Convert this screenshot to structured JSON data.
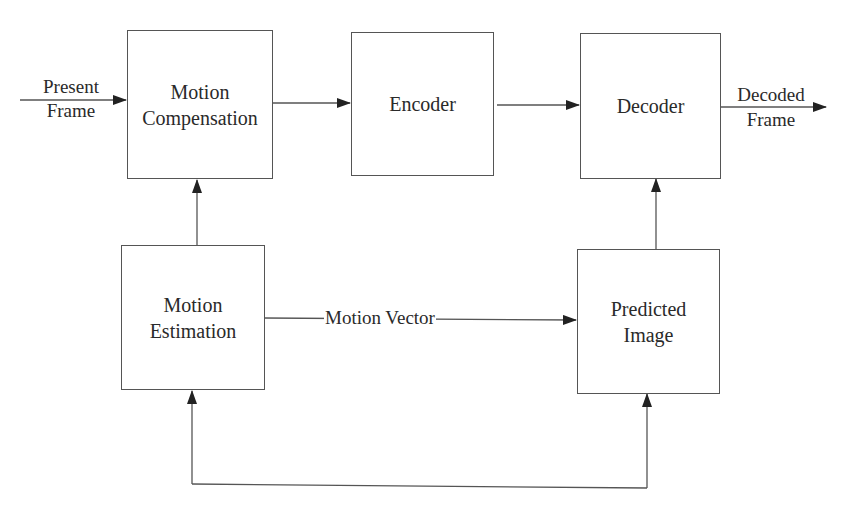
{
  "diagram": {
    "type": "block-diagram",
    "blocks": {
      "motion_compensation": {
        "line1": "Motion",
        "line2": "Compensation"
      },
      "encoder": {
        "label": "Encoder"
      },
      "decoder": {
        "label": "Decoder"
      },
      "motion_estimation": {
        "line1": "Motion",
        "line2": "Estimation"
      },
      "predicted_image": {
        "line1": "Predicted",
        "line2": "Image"
      }
    },
    "labels": {
      "input": {
        "line1": "Present",
        "line2": "Frame"
      },
      "output": {
        "line1": "Decoded",
        "line2": "Frame"
      },
      "motion_vector": "Motion Vector"
    },
    "edges": [
      {
        "from": "Present Frame",
        "to": "Motion Compensation"
      },
      {
        "from": "Motion Compensation",
        "to": "Encoder"
      },
      {
        "from": "Encoder",
        "to": "Decoder"
      },
      {
        "from": "Decoder",
        "to": "Decoded Frame"
      },
      {
        "from": "Motion Estimation",
        "to": "Motion Compensation"
      },
      {
        "from": "Motion Estimation",
        "to": "Predicted Image",
        "label": "Motion Vector"
      },
      {
        "from": "Predicted Image",
        "to": "Decoder"
      },
      {
        "from": "bottom loop",
        "to": "Motion Estimation"
      },
      {
        "from": "bottom loop",
        "to": "Predicted Image"
      }
    ]
  }
}
